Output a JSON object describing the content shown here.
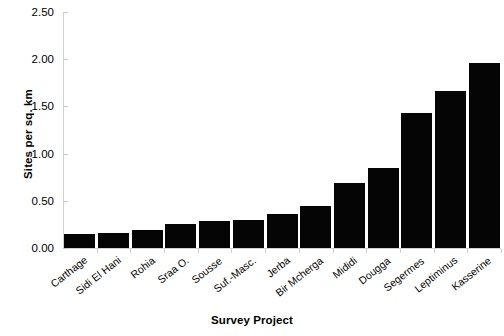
{
  "chart_data": {
    "type": "bar",
    "title": "",
    "xlabel": "Survey Project",
    "ylabel": "Sites per sq. km",
    "categories": [
      "Carthage",
      "Sidi El Hani",
      "Rohia",
      "Sraa O.",
      "Sousse",
      "Suf.-Masc.",
      "Jerba",
      "Bir Mcherga",
      "Mididi",
      "Dougga",
      "Segermes",
      "Leptiminus",
      "Kasserine"
    ],
    "values": [
      0.15,
      0.16,
      0.19,
      0.25,
      0.29,
      0.3,
      0.36,
      0.44,
      0.69,
      0.85,
      1.43,
      1.66,
      1.96
    ],
    "ylim": [
      0,
      2.5
    ],
    "yticks": [
      0,
      0.5,
      1.0,
      1.5,
      2.0,
      2.5
    ],
    "ytick_labels": [
      "0.00",
      "0.50",
      "1.00",
      "1.50",
      "2.00",
      "2.50"
    ],
    "grid": false,
    "legend": "none",
    "bar_color": "#050505",
    "axis_color": "#d2d2d2",
    "xtick_label_rotation": -38
  }
}
